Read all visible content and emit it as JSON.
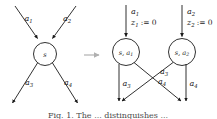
{
  "figure": {
    "caption": "Fig. 1. The ... distinguishes ...",
    "transform_arrow": "→",
    "left": {
      "node": {
        "label": "s"
      },
      "incoming": [
        {
          "name": "a1",
          "base": "a",
          "sub": "1"
        },
        {
          "name": "a2",
          "base": "a",
          "sub": "2"
        }
      ],
      "outgoing": [
        {
          "name": "a3",
          "base": "a",
          "sub": "3"
        },
        {
          "name": "a4",
          "base": "a",
          "sub": "4"
        }
      ]
    },
    "right": {
      "nodes": [
        {
          "base": "s",
          "sep": ", ",
          "action": "a",
          "action_sub": "1"
        },
        {
          "base": "s",
          "sep": ", ",
          "action": "a",
          "action_sub": "2"
        }
      ],
      "incoming": [
        {
          "action_base": "a",
          "action_sub": "1",
          "clock_base": "z",
          "clock_sub": "1",
          "assign": ":=",
          "value": "0"
        },
        {
          "action_base": "a",
          "action_sub": "2",
          "clock_base": "z",
          "clock_sub": "2",
          "assign": ":=",
          "value": "0"
        }
      ],
      "outgoing": [
        {
          "base": "a",
          "sub": "3",
          "from": "node1",
          "to": "sink1"
        },
        {
          "base": "a",
          "sub": "4",
          "from": "node1",
          "to": "sink2"
        },
        {
          "base": "a",
          "sub": "3",
          "from": "node2",
          "to": "sink1"
        },
        {
          "base": "a",
          "sub": "4",
          "from": "node2",
          "to": "sink2"
        }
      ]
    }
  },
  "colors": {
    "ink": "#1a1a1a",
    "background": "#ffffff",
    "transform_arrow": "#b0b0b0",
    "caption": "#4a4a4a"
  }
}
